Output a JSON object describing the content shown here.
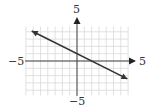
{
  "chart_data": {
    "type": "line",
    "title": "",
    "xlabel": "",
    "ylabel": "",
    "axis_labels": {
      "x_min": "−5",
      "x_max": "5",
      "y_min": "−5",
      "y_max": "5"
    },
    "grid": true,
    "xlim": [
      -7,
      7
    ],
    "ylim": [
      -4.5,
      4.5
    ],
    "series": [
      {
        "name": "line",
        "equation": "y = -x/2 + 1",
        "x": [
          -6.2,
          6.9
        ],
        "y": [
          4.1,
          -2.45
        ],
        "arrows_both_ends": true
      }
    ],
    "colors": {
      "grid": "#d9d9d9",
      "axis": "#444444",
      "line": "#333333"
    }
  }
}
